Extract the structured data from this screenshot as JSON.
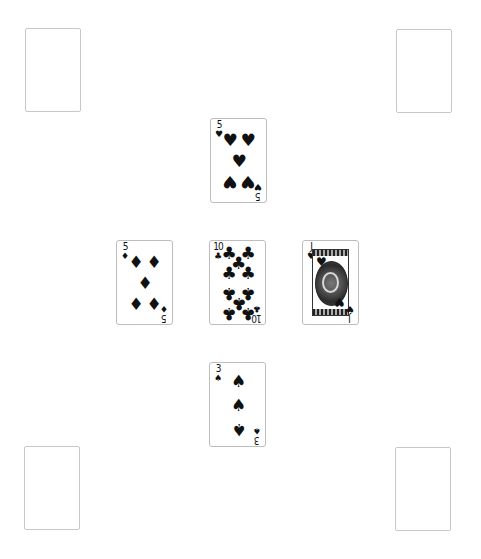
{
  "table": {
    "background": "#ffffff",
    "empty_slots": [
      {
        "position": "top-left"
      },
      {
        "position": "top-right"
      },
      {
        "position": "bottom-left"
      },
      {
        "position": "bottom-right"
      }
    ],
    "played_cards": {
      "north": {
        "rank": "5",
        "suit": "hearts",
        "suit_glyph": "♥"
      },
      "west": {
        "rank": "5",
        "suit": "diamonds",
        "suit_glyph": "♦"
      },
      "center": {
        "rank": "10",
        "suit": "clubs",
        "suit_glyph": "♣"
      },
      "east": {
        "rank": "J",
        "suit": "hearts",
        "suit_glyph": "♥"
      },
      "south": {
        "rank": "3",
        "suit": "spades",
        "suit_glyph": "♠"
      }
    }
  }
}
